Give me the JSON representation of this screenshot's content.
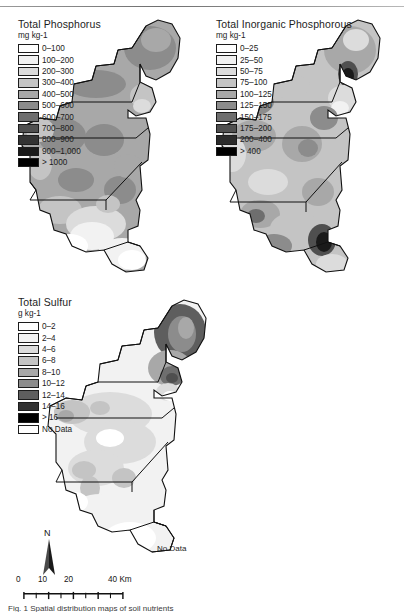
{
  "figure": {
    "caption_fragment": "Fig. 1  Spatial distribution maps of soil nutrients"
  },
  "panels": [
    {
      "id": "total-phosphorus",
      "title": "Total Phosphorus",
      "units": "mg kg-1",
      "classes": [
        {
          "label": "0–100",
          "color": "#ffffff"
        },
        {
          "label": "100–200",
          "color": "#f2f2f2"
        },
        {
          "label": "200–300",
          "color": "#dcdcdc"
        },
        {
          "label": "300–400",
          "color": "#c4c4c4"
        },
        {
          "label": "400–500",
          "color": "#a8a8a8"
        },
        {
          "label": "500–600",
          "color": "#8c8c8c"
        },
        {
          "label": "600–700",
          "color": "#6e6e6e"
        },
        {
          "label": "700–800",
          "color": "#4f4f4f"
        },
        {
          "label": "800–900",
          "color": "#333333"
        },
        {
          "label": "900–1,000",
          "color": "#1a1a1a"
        },
        {
          "label": "> 1000",
          "color": "#000000"
        }
      ]
    },
    {
      "id": "total-inorganic-phosphorous",
      "title": "Total Inorganic Phosphorous",
      "units": "mg kg-1",
      "classes": [
        {
          "label": "0–25",
          "color": "#ffffff"
        },
        {
          "label": "25–50",
          "color": "#f2f2f2"
        },
        {
          "label": "50–75",
          "color": "#dcdcdc"
        },
        {
          "label": "75–100",
          "color": "#c4c4c4"
        },
        {
          "label": "100–125",
          "color": "#a8a8a8"
        },
        {
          "label": "125–150",
          "color": "#8c8c8c"
        },
        {
          "label": "150–175",
          "color": "#6e6e6e"
        },
        {
          "label": "175–200",
          "color": "#4f4f4f"
        },
        {
          "label": "200–400",
          "color": "#2b2b2b"
        },
        {
          "label": "> 400",
          "color": "#000000"
        }
      ]
    },
    {
      "id": "total-sulfur",
      "title": "Total Sulfur",
      "units": "g kg-1",
      "classes": [
        {
          "label": "0–2",
          "color": "#ffffff"
        },
        {
          "label": "2–4",
          "color": "#f2f2f2"
        },
        {
          "label": "4–6",
          "color": "#dcdcdc"
        },
        {
          "label": "6–8",
          "color": "#c4c4c4"
        },
        {
          "label": "8–10",
          "color": "#a8a8a8"
        },
        {
          "label": "10–12",
          "color": "#8c8c8c"
        },
        {
          "label": "12–14",
          "color": "#5e5e5e"
        },
        {
          "label": "14–16",
          "color": "#333333"
        },
        {
          "label": "> 16",
          "color": "#000000"
        },
        {
          "label": "No Data",
          "color": "#ffffff"
        }
      ],
      "nodata_label": "No Data"
    }
  ],
  "map_annotations": {
    "nodata_tp": "No Data"
  },
  "north_arrow": {
    "label": "N"
  },
  "scalebar": {
    "ticks": [
      "0",
      "10",
      "20"
    ],
    "end_label": "40 Km",
    "tick_values": [
      0,
      10,
      20,
      30,
      40
    ]
  }
}
